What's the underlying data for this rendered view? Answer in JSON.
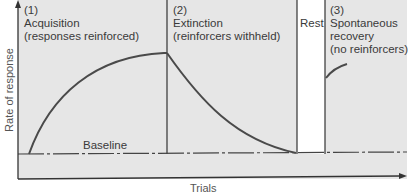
{
  "diagram": {
    "y_axis_label": "Rate of response",
    "x_axis_label": "Trials",
    "baseline_label": "Baseline",
    "phases": [
      {
        "number": "(1)",
        "name": "Acquisition",
        "note": "(responses reinforced)"
      },
      {
        "number": "(2)",
        "name": "Extinction",
        "note": "(reinforcers withheld)"
      },
      {
        "name": "Rest"
      },
      {
        "number": "(3)",
        "name": "Spontaneous",
        "name2": "recovery",
        "note": "(no reinforcers)"
      }
    ],
    "colors": {
      "panel": "#e6e6e6",
      "curve": "#4a4a4a",
      "axis": "#333333",
      "rest": "#ffffff"
    }
  }
}
